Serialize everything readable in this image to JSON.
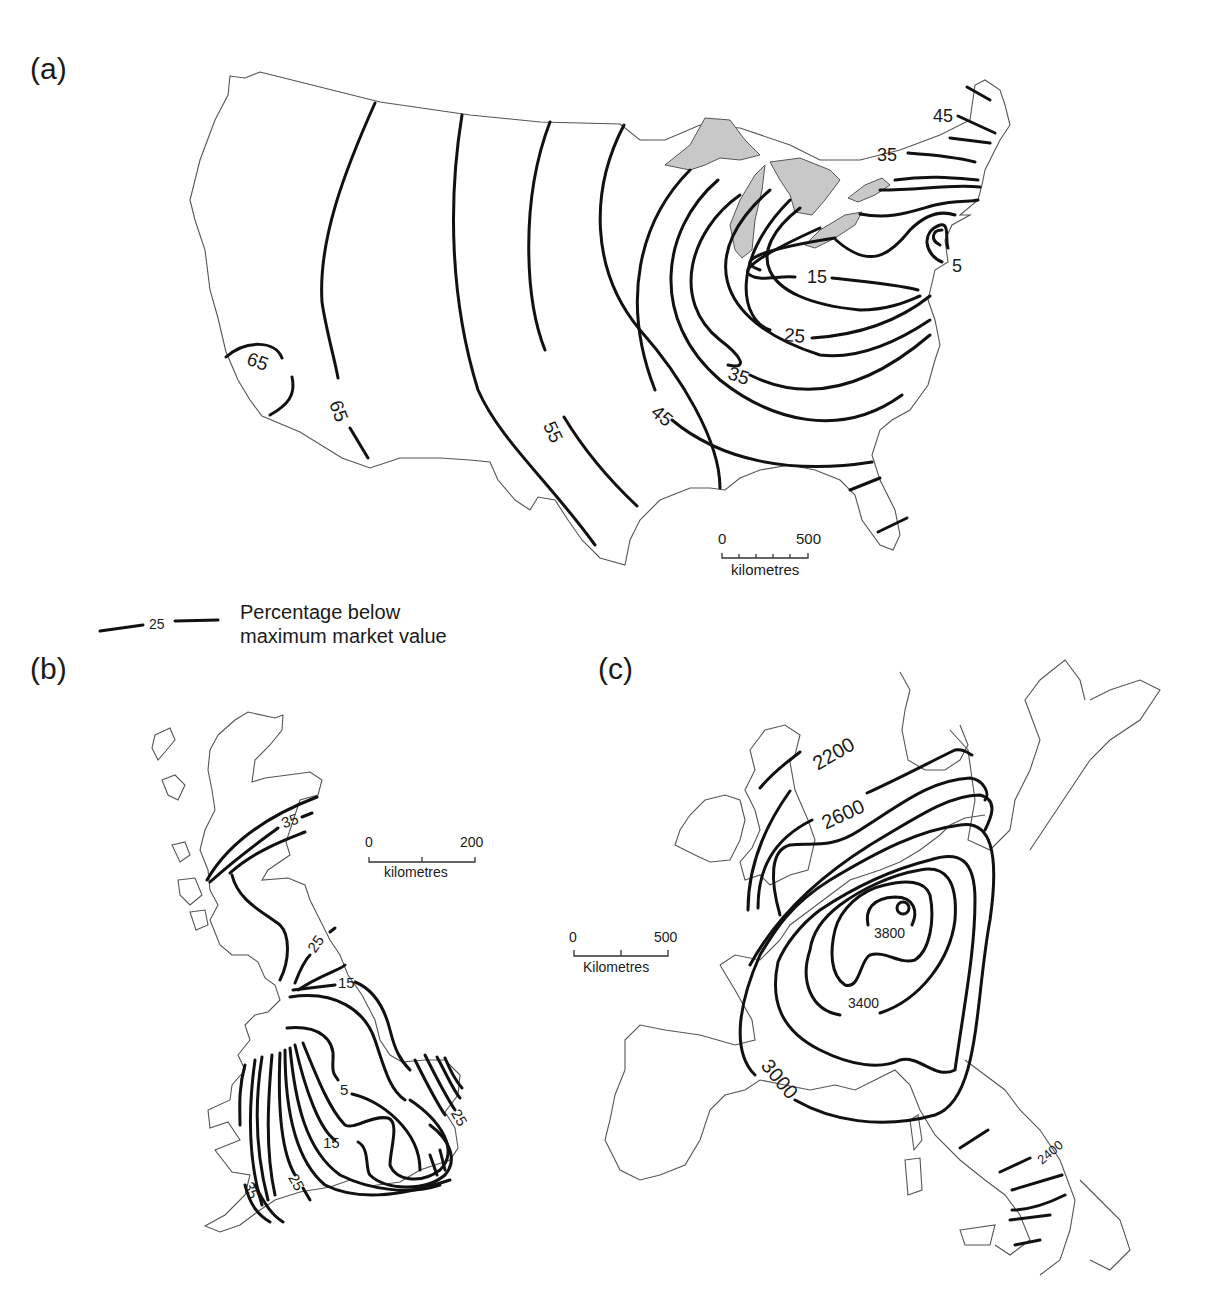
{
  "panels": {
    "a": {
      "label": "(a)",
      "region": "United States",
      "contour_labels": [
        "65",
        "65",
        "55",
        "45",
        "45",
        "35",
        "35",
        "25",
        "15",
        "5"
      ],
      "scale": {
        "start": "0",
        "end": "500",
        "unit": "kilometres"
      }
    },
    "b": {
      "label": "(b)",
      "region": "Great Britain",
      "contour_labels": [
        "35",
        "25",
        "15",
        "5",
        "15",
        "25",
        "25",
        "35"
      ],
      "scale": {
        "start": "0",
        "end": "200",
        "unit": "kilometres"
      }
    },
    "c": {
      "label": "(c)",
      "region": "Western Europe",
      "contour_labels": [
        "2200",
        "2600",
        "3800",
        "3400",
        "3000",
        "2400"
      ],
      "scale": {
        "start": "0",
        "end": "500",
        "unit": "Kilometres"
      }
    }
  },
  "legend": {
    "sample_value": "25",
    "line1": "Percentage below",
    "line2": "maximum market value"
  },
  "labels": {
    "a_65_west": "65",
    "a_65": "65",
    "a_55": "55",
    "a_45_sw": "45",
    "a_45_ne": "45",
    "a_35_ne": "35",
    "a_35": "35",
    "a_25": "25",
    "a_15": "15",
    "a_5": "5",
    "b_35_n": "35",
    "b_25_n": "25",
    "b_15_n": "15",
    "b_5": "5",
    "b_15_s": "15",
    "b_25_e": "25",
    "b_25_sw": "25",
    "b_35_sw": "35",
    "c_2200": "2200",
    "c_2600": "2600",
    "c_3800": "3800",
    "c_3400": "3400",
    "c_3000": "3000",
    "c_2400": "2400"
  },
  "colors": {
    "contour": "#111111",
    "coastline": "#555555",
    "lakes": "#c8c8c8",
    "background": "#ffffff"
  }
}
